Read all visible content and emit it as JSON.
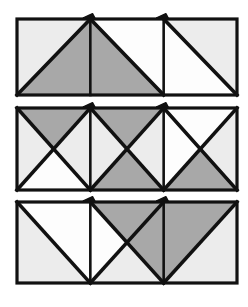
{
  "figure": {
    "type": "geometric-diagram",
    "background_color": "#ffffff",
    "stroke_color": "#111111",
    "border_width": 3.2,
    "diagonal_width": 3.6,
    "divider_width": 2.6,
    "fills": {
      "white": "#fdfdfd",
      "light_gray": "#ececec",
      "dark_gray": "#a8a8a8"
    },
    "canvas": {
      "width": 248,
      "height": 307
    }
  },
  "geometry": {
    "left": 17,
    "right": 237,
    "cell_width": 73.33,
    "bands": [
      {
        "name": "band-top",
        "top": 19,
        "bottom": 95
      },
      {
        "name": "band-middle",
        "top": 108,
        "bottom": 190
      },
      {
        "name": "band-bottom",
        "top": 202,
        "bottom": 283
      }
    ]
  },
  "bands": [
    {
      "id": "band-top",
      "label": "Band 1",
      "cells": [
        {
          "id": "band1-cell1",
          "label": "Cell 1-1",
          "diagonals": [
            "bl-tr"
          ],
          "regions": [
            {
              "name": "upper-left-triangle",
              "shade": "light_gray"
            },
            {
              "name": "lower-right-triangle",
              "shade": "dark_gray"
            }
          ]
        },
        {
          "id": "band1-cell2",
          "label": "Cell 1-2",
          "diagonals": [
            "tl-br"
          ],
          "regions": [
            {
              "name": "lower-left-triangle",
              "shade": "dark_gray"
            },
            {
              "name": "upper-right-triangle",
              "shade": "white"
            }
          ]
        },
        {
          "id": "band1-cell3",
          "label": "Cell 1-3",
          "diagonals": [
            "tl-br"
          ],
          "regions": [
            {
              "name": "lower-left-triangle",
              "shade": "white"
            },
            {
              "name": "upper-right-triangle",
              "shade": "light_gray"
            }
          ]
        }
      ]
    },
    {
      "id": "band-middle",
      "label": "Band 2",
      "cells": [
        {
          "id": "band2-cell1",
          "label": "Cell 2-1",
          "diagonals": [
            "tl-br",
            "bl-tr"
          ],
          "regions": [
            {
              "name": "top-triangle",
              "shade": "dark_gray"
            },
            {
              "name": "left-triangle",
              "shade": "light_gray"
            },
            {
              "name": "right-triangle",
              "shade": "light_gray"
            },
            {
              "name": "bottom-triangle",
              "shade": "white"
            }
          ]
        },
        {
          "id": "band2-cell2",
          "label": "Cell 2-2",
          "diagonals": [
            "tl-br",
            "bl-tr"
          ],
          "regions": [
            {
              "name": "top-triangle",
              "shade": "dark_gray"
            },
            {
              "name": "left-triangle",
              "shade": "light_gray"
            },
            {
              "name": "right-triangle",
              "shade": "light_gray"
            },
            {
              "name": "bottom-triangle",
              "shade": "dark_gray"
            }
          ]
        },
        {
          "id": "band2-cell3",
          "label": "Cell 2-3",
          "diagonals": [
            "tl-br",
            "bl-tr"
          ],
          "regions": [
            {
              "name": "top-triangle",
              "shade": "white"
            },
            {
              "name": "left-triangle",
              "shade": "white"
            },
            {
              "name": "right-triangle",
              "shade": "light_gray"
            },
            {
              "name": "bottom-triangle",
              "shade": "dark_gray"
            }
          ]
        }
      ]
    },
    {
      "id": "band-bottom",
      "label": "Band 3",
      "cells": [
        {
          "id": "band3-cell1",
          "label": "Cell 3-1",
          "diagonals": [
            "tl-br"
          ],
          "regions": [
            {
              "name": "lower-left-triangle",
              "shade": "light_gray"
            },
            {
              "name": "upper-right-triangle",
              "shade": "white"
            }
          ]
        },
        {
          "id": "band3-cell2",
          "label": "Cell 3-2",
          "diagonals": [
            "tl-br",
            "bl-tr"
          ],
          "regions": [
            {
              "name": "top-triangle",
              "shade": "dark_gray"
            },
            {
              "name": "left-triangle",
              "shade": "white"
            },
            {
              "name": "right-triangle",
              "shade": "dark_gray"
            },
            {
              "name": "bottom-triangle",
              "shade": "light_gray"
            }
          ]
        },
        {
          "id": "band3-cell3",
          "label": "Cell 3-3",
          "diagonals": [
            "bl-tr"
          ],
          "regions": [
            {
              "name": "upper-left-triangle",
              "shade": "dark_gray"
            },
            {
              "name": "lower-right-triangle",
              "shade": "light_gray"
            }
          ]
        }
      ]
    }
  ],
  "ticks": [
    {
      "id": "tick-band1-a",
      "band": 0,
      "at_cell_boundary": 1
    },
    {
      "id": "tick-band1-b",
      "band": 0,
      "at_cell_boundary": 2
    },
    {
      "id": "tick-band2-a",
      "band": 1,
      "at_cell_boundary": 1
    },
    {
      "id": "tick-band2-b",
      "band": 1,
      "at_cell_boundary": 2
    },
    {
      "id": "tick-band3-a",
      "band": 2,
      "at_cell_boundary": 1
    },
    {
      "id": "tick-band3-b",
      "band": 2,
      "at_cell_boundary": 2
    }
  ]
}
